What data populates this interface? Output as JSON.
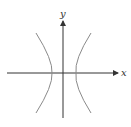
{
  "diagram": {
    "type": "hyperbola",
    "axes": {
      "x_label": "x",
      "y_label": "y"
    },
    "colors": {
      "axis": "#333333",
      "curve": "#8a8a8a",
      "label": "#333333"
    }
  }
}
